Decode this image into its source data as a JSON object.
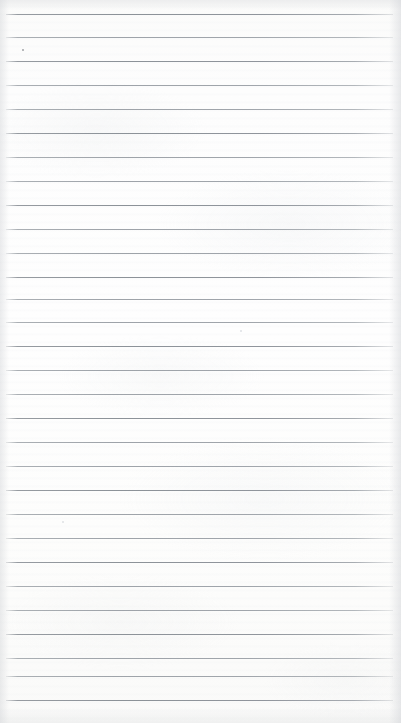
{
  "image": {
    "subject": "blank-ruled-notebook-page",
    "description": "Scan of an empty lined writing-paper sheet with no handwriting or printed text",
    "width_px": 401,
    "height_px": 723,
    "orientation": "portrait",
    "text_content": "",
    "has_writing": false
  },
  "paper": {
    "base_color": "#fdfdfd",
    "shade_top": "#fbfbfa",
    "shade_bottom": "#fafaf9",
    "edge_shadow_color": "#d6d8db"
  },
  "ruling": {
    "line_color": "#a0a5ab",
    "strong_line_color": "#8c9298",
    "line_thickness_px": 1,
    "spacing_px": 24,
    "left_inset_px": 6,
    "right_inset_px": 8,
    "line_count": 29,
    "first_line_y": 14,
    "positions": [
      {
        "y": 14,
        "weight": "strong"
      },
      {
        "y": 37,
        "weight": "normal"
      },
      {
        "y": 61,
        "weight": "strong"
      },
      {
        "y": 85,
        "weight": "normal"
      },
      {
        "y": 109,
        "weight": "normal"
      },
      {
        "y": 133,
        "weight": "strong"
      },
      {
        "y": 157,
        "weight": "normal"
      },
      {
        "y": 181,
        "weight": "normal"
      },
      {
        "y": 205,
        "weight": "strong"
      },
      {
        "y": 229,
        "weight": "normal"
      },
      {
        "y": 253,
        "weight": "normal"
      },
      {
        "y": 277,
        "weight": "strong"
      },
      {
        "y": 299,
        "weight": "normal"
      },
      {
        "y": 322,
        "weight": "normal"
      },
      {
        "y": 346,
        "weight": "strong"
      },
      {
        "y": 370,
        "weight": "normal"
      },
      {
        "y": 394,
        "weight": "normal"
      },
      {
        "y": 418,
        "weight": "strong"
      },
      {
        "y": 442,
        "weight": "normal"
      },
      {
        "y": 466,
        "weight": "normal"
      },
      {
        "y": 490,
        "weight": "strong"
      },
      {
        "y": 514,
        "weight": "normal"
      },
      {
        "y": 538,
        "weight": "normal"
      },
      {
        "y": 562,
        "weight": "strong"
      },
      {
        "y": 586,
        "weight": "normal"
      },
      {
        "y": 610,
        "weight": "normal"
      },
      {
        "y": 634,
        "weight": "strong"
      },
      {
        "y": 658,
        "weight": "normal"
      },
      {
        "y": 676,
        "weight": "normal"
      },
      {
        "y": 700,
        "weight": "strong"
      }
    ]
  },
  "marks": [
    {
      "name": "speck-upper-left",
      "x": 22,
      "y": 49,
      "size": 2,
      "tone": "dark"
    },
    {
      "name": "speck-mid-center",
      "x": 240,
      "y": 330,
      "size": 2,
      "tone": "light"
    },
    {
      "name": "speck-lower-left",
      "x": 62,
      "y": 521,
      "size": 2,
      "tone": "light"
    }
  ]
}
